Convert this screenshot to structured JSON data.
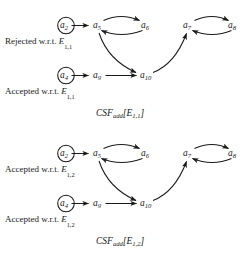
{
  "figure": {
    "ink_color": "#1a1a1a",
    "background_color": "#ffffff"
  },
  "panels": [
    {
      "id": "panel-top",
      "caption": {
        "base": "CSF",
        "sub": "add",
        "open": "[",
        "arg": "E",
        "arg_sub": "1,1",
        "close": "]"
      },
      "status_labels": [
        {
          "id": "status-rejected-e11",
          "text": "Rejected w.r.t. ",
          "symbol": "E",
          "subscript": "1,1",
          "row": "upper"
        },
        {
          "id": "status-accepted-e11",
          "text": "Accepted w.r.t. ",
          "symbol": "E",
          "subscript": "1,1",
          "row": "lower"
        }
      ],
      "nodes": [
        {
          "id": "a2",
          "label": "a",
          "subscript": "2",
          "circled": true,
          "x": 62,
          "y": 26
        },
        {
          "id": "a5",
          "label": "a",
          "subscript": "5",
          "circled": false,
          "x": 96,
          "y": 26
        },
        {
          "id": "a6",
          "label": "a",
          "subscript": "6",
          "circled": false,
          "x": 144,
          "y": 26
        },
        {
          "id": "a7",
          "label": "a",
          "subscript": "7",
          "circled": false,
          "x": 186,
          "y": 26
        },
        {
          "id": "a8",
          "label": "a",
          "subscript": "8",
          "circled": false,
          "x": 231,
          "y": 26
        },
        {
          "id": "a4",
          "label": "a",
          "subscript": "4",
          "circled": true,
          "x": 62,
          "y": 76
        },
        {
          "id": "a9",
          "label": "a",
          "subscript": "9",
          "circled": false,
          "x": 96,
          "y": 76
        },
        {
          "id": "a10",
          "label": "a",
          "subscript": "10",
          "circled": false,
          "x": 143,
          "y": 76
        }
      ],
      "edges": [
        {
          "from": "a2",
          "to": "a5",
          "shape": "straight"
        },
        {
          "from": "a5",
          "to": "a6",
          "shape": "curve-over"
        },
        {
          "from": "a6",
          "to": "a5",
          "shape": "curve-under"
        },
        {
          "from": "a7",
          "to": "a8",
          "shape": "curve-over"
        },
        {
          "from": "a8",
          "to": "a7",
          "shape": "curve-under"
        },
        {
          "from": "a4",
          "to": "a9",
          "shape": "straight"
        },
        {
          "from": "a9",
          "to": "a10",
          "shape": "straight"
        },
        {
          "from": "a5",
          "to": "a10",
          "shape": "curve-down-right"
        },
        {
          "from": "a10",
          "to": "a7",
          "shape": "curve-up-right"
        }
      ]
    },
    {
      "id": "panel-bottom",
      "caption": {
        "base": "CSF",
        "sub": "add",
        "open": "[",
        "arg": "E",
        "arg_sub": "1,2",
        "close": "]"
      },
      "status_labels": [
        {
          "id": "status-accepted-e12-upper",
          "text": "Accepted w.r.t. ",
          "symbol": "E",
          "subscript": "1,2",
          "row": "upper"
        },
        {
          "id": "status-accepted-e12-lower",
          "text": "Accepted w.r.t. ",
          "symbol": "E",
          "subscript": "1,2",
          "row": "lower"
        }
      ],
      "nodes": [
        {
          "id": "a2",
          "label": "a",
          "subscript": "2",
          "circled": true,
          "x": 62,
          "y": 26
        },
        {
          "id": "a5",
          "label": "a",
          "subscript": "5",
          "circled": false,
          "x": 96,
          "y": 26
        },
        {
          "id": "a6",
          "label": "a",
          "subscript": "6",
          "circled": false,
          "x": 144,
          "y": 26
        },
        {
          "id": "a7",
          "label": "a",
          "subscript": "7",
          "circled": false,
          "x": 186,
          "y": 26
        },
        {
          "id": "a8",
          "label": "a",
          "subscript": "8",
          "circled": false,
          "x": 231,
          "y": 26
        },
        {
          "id": "a4",
          "label": "a",
          "subscript": "4",
          "circled": true,
          "x": 62,
          "y": 76
        },
        {
          "id": "a9",
          "label": "a",
          "subscript": "9",
          "circled": false,
          "x": 96,
          "y": 76
        },
        {
          "id": "a10",
          "label": "a",
          "subscript": "10",
          "circled": false,
          "x": 143,
          "y": 76
        }
      ],
      "edges": [
        {
          "from": "a2",
          "to": "a5",
          "shape": "straight"
        },
        {
          "from": "a5",
          "to": "a6",
          "shape": "curve-over"
        },
        {
          "from": "a6",
          "to": "a5",
          "shape": "curve-under"
        },
        {
          "from": "a7",
          "to": "a8",
          "shape": "curve-over"
        },
        {
          "from": "a8",
          "to": "a7",
          "shape": "curve-under"
        },
        {
          "from": "a4",
          "to": "a9",
          "shape": "straight"
        },
        {
          "from": "a9",
          "to": "a10",
          "shape": "straight"
        },
        {
          "from": "a5",
          "to": "a10",
          "shape": "curve-down-right"
        },
        {
          "from": "a10",
          "to": "a7",
          "shape": "curve-up-right"
        }
      ]
    }
  ]
}
